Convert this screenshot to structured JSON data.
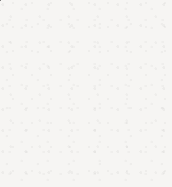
{
  "figure": {
    "canvas": {
      "width": 172,
      "height": 187,
      "background_color": "#f6f5f3"
    },
    "circle": {
      "name": "outer-circle",
      "center_x": 86,
      "center_y": 101,
      "radius": 72
    },
    "left_half": {
      "label": "shaded-half",
      "fill_color": "#b5b5b5",
      "stroke_color": "#333333",
      "stroke_width": 2.6,
      "position": "left"
    },
    "right_half": {
      "label": "unshaded-half",
      "fill_color": "#fbfaf8",
      "stroke_color": "#5a5a5a",
      "stroke_width": 1.5,
      "position": "right"
    },
    "divider": {
      "label": "vertical-diameter-line",
      "x": 86,
      "y_start": 18,
      "y_end": 181,
      "stroke_color": "#3c3c3c",
      "stroke_width": 1.7
    },
    "markers": [
      {
        "label": "filled-dot",
        "style": "solid",
        "cx": 48,
        "cy": 99,
        "r": 4.2,
        "fill_color": "#111111",
        "stroke_color": "#111111",
        "stroke_width": 0
      },
      {
        "label": "hollow-dot",
        "style": "outline",
        "cx": 125,
        "cy": 99,
        "r": 4.0,
        "fill_color": "#fdfcfa",
        "stroke_color": "#1e1e1e",
        "stroke_width": 1.7
      }
    ]
  }
}
